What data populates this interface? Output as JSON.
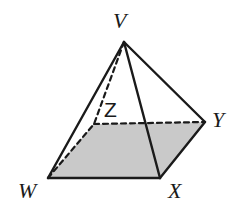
{
  "figure": {
    "name": "square-pyramid",
    "background_color": "#ffffff",
    "stroke_color": "#1a1a1a",
    "base_fill_color": "#c9c9c9",
    "stroke_width": 2.2,
    "dash_pattern": "5,4"
  },
  "vertices": {
    "V": {
      "label": "V",
      "x": 124,
      "y": 42,
      "label_x": 113,
      "label_y": 28,
      "style": "italic"
    },
    "W": {
      "label": "W",
      "x": 48,
      "y": 178,
      "label_x": 18,
      "label_y": 198,
      "style": "italic"
    },
    "X": {
      "label": "X",
      "x": 160,
      "y": 178,
      "label_x": 168,
      "label_y": 198,
      "style": "italic"
    },
    "Y": {
      "label": "Y",
      "x": 205,
      "y": 122,
      "label_x": 212,
      "label_y": 127,
      "style": "italic"
    },
    "Z": {
      "label": "Z",
      "x": 94,
      "y": 124,
      "label_x": 104,
      "label_y": 117,
      "style": "upright"
    }
  },
  "faces": [
    {
      "name": "base-WXYZ",
      "points": "48,178 160,178 205,122 94,124",
      "fill": "#c9c9c9",
      "shaded": true
    },
    {
      "name": "face-VWX",
      "points": "124,42 48,178 160,178",
      "fill": "none",
      "shaded": false
    },
    {
      "name": "face-VXY",
      "points": "124,42 160,178 205,122",
      "fill": "none",
      "shaded": false
    }
  ],
  "edges": [
    {
      "name": "edge-VW",
      "from": "V",
      "to": "W",
      "style": "solid",
      "visible": true
    },
    {
      "name": "edge-VX",
      "from": "V",
      "to": "X",
      "style": "solid",
      "visible": true
    },
    {
      "name": "edge-VY",
      "from": "V",
      "to": "Y",
      "style": "solid",
      "visible": true
    },
    {
      "name": "edge-VZ",
      "from": "V",
      "to": "Z",
      "style": "dashed",
      "visible": false
    },
    {
      "name": "edge-WX",
      "from": "W",
      "to": "X",
      "style": "solid",
      "visible": true
    },
    {
      "name": "edge-XY",
      "from": "X",
      "to": "Y",
      "style": "solid",
      "visible": true
    },
    {
      "name": "edge-WZ",
      "from": "W",
      "to": "Z",
      "style": "dashed",
      "visible": false
    },
    {
      "name": "edge-ZY",
      "from": "Z",
      "to": "Y",
      "style": "dashed",
      "visible": false
    }
  ]
}
